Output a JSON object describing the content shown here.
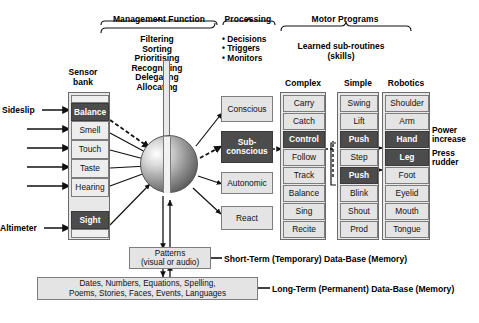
{
  "groups": {
    "management": {
      "title": "Management Function",
      "lines": [
        "Filtering",
        "Sorting",
        "Prioritising",
        "Recognising",
        "Delegating",
        "Allocating"
      ]
    },
    "processing": {
      "title": "Processing",
      "bullets": [
        "Decisions",
        "Triggers",
        "Monitors"
      ]
    },
    "motor": {
      "title": "Motor Programs",
      "subtitle_line1": "Learned sub-routines",
      "subtitle_line2": "(skills)"
    }
  },
  "columns": {
    "sensor_header_line1": "Sensor",
    "sensor_header_line2": "bank",
    "complex": "Complex",
    "simple": "Simple",
    "robotics": "Robotics"
  },
  "sensor_bank": {
    "items": [
      {
        "label": "",
        "state": "blank"
      },
      {
        "label": "Balance",
        "state": "dark"
      },
      {
        "label": "Smell",
        "state": "light"
      },
      {
        "label": "Touch",
        "state": "light"
      },
      {
        "label": "Taste",
        "state": "light"
      },
      {
        "label": "Hearing",
        "state": "light"
      },
      {
        "label": "Sight",
        "state": "dark"
      },
      {
        "label": "",
        "state": "blank"
      }
    ],
    "input_labels": {
      "top": "Sideslip",
      "bottom": "Altimeter"
    }
  },
  "awareness": {
    "items": [
      {
        "label": "Conscious",
        "state": "light"
      },
      {
        "label_line1": "Sub-",
        "label_line2": "conscious",
        "state": "dark"
      },
      {
        "label": "Autonomic",
        "state": "light"
      },
      {
        "label": "React",
        "state": "light"
      }
    ]
  },
  "complex_list": [
    {
      "label": "Carry",
      "state": "light"
    },
    {
      "label": "Catch",
      "state": "light"
    },
    {
      "label": "Control",
      "state": "dark"
    },
    {
      "label": "Follow",
      "state": "light"
    },
    {
      "label": "Track",
      "state": "light"
    },
    {
      "label": "Balance",
      "state": "light"
    },
    {
      "label": "Sing",
      "state": "light"
    },
    {
      "label": "Recite",
      "state": "light"
    }
  ],
  "simple_list": [
    {
      "label": "Swing",
      "state": "light"
    },
    {
      "label": "Lift",
      "state": "light"
    },
    {
      "label": "Push",
      "state": "dark"
    },
    {
      "label": "Step",
      "state": "light"
    },
    {
      "label": "Push",
      "state": "dark"
    },
    {
      "label": "Blink",
      "state": "light"
    },
    {
      "label": "Shout",
      "state": "light"
    },
    {
      "label": "Prod",
      "state": "light"
    }
  ],
  "robotics_list": [
    {
      "label": "Shoulder",
      "state": "light"
    },
    {
      "label": "Arm",
      "state": "light"
    },
    {
      "label": "Hand",
      "state": "dark"
    },
    {
      "label": "Leg",
      "state": "dark"
    },
    {
      "label": "Foot",
      "state": "light"
    },
    {
      "label": "Eyelid",
      "state": "light"
    },
    {
      "label": "Mouth",
      "state": "light"
    },
    {
      "label": "Tongue",
      "state": "light"
    }
  ],
  "outputs": [
    {
      "line1": "Power",
      "line2": "increase"
    },
    {
      "line1": "Press",
      "line2": "rudder"
    }
  ],
  "memory": {
    "short_term": {
      "box_line1": "Patterns",
      "box_line2": "(visual or audio)",
      "label": "Short-Term (Temporary) Data-Base (Memory)"
    },
    "long_term": {
      "box_line1": "Dates, Numbers, Equations, Spelling,",
      "box_line2": "Poems, Stories, Faces, Events, Languages",
      "label": "Long-Term (Permanent) Data-Base (Memory)"
    }
  },
  "colors": {
    "dark_cell": "#4c4c4c",
    "light_cell": "#e4e4e4",
    "border": "#7d7d7d"
  }
}
